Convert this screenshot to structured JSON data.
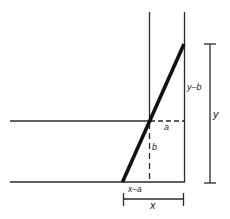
{
  "diagram": {
    "colors": {
      "line": "#2a2a2a",
      "thick_line": "#111111",
      "background": "#ffffff"
    },
    "labels": {
      "a": "a",
      "b": "b",
      "y_minus_b": "y–b",
      "x_minus_a": "x–a",
      "x": "x",
      "y": "y"
    }
  }
}
